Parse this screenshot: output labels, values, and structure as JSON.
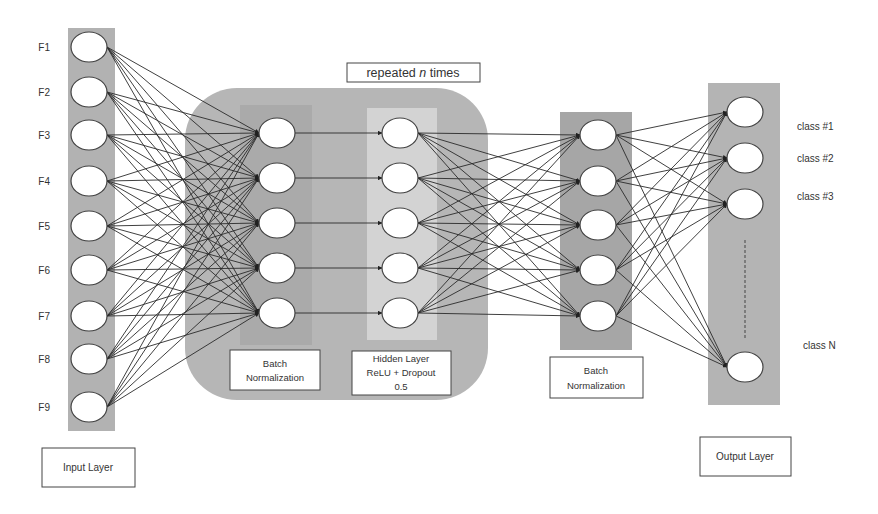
{
  "colors": {
    "background": "#ffffff",
    "input_column": "#b2b2b2",
    "repeated_block": "#b6b6b6",
    "bn_inner": "#a9a9a9",
    "hidden_inner": "#d3d3d3",
    "bn2_column": "#a6a6a6",
    "output_column": "#b4b4b4",
    "node_fill": "#ffffff",
    "node_stroke": "#444444",
    "edge": "#2a2a2a"
  },
  "input_layer": {
    "label": "Input Layer",
    "features": [
      "F1",
      "F2",
      "F3",
      "F4",
      "F5",
      "F6",
      "F7",
      "F8",
      "F9"
    ]
  },
  "repeated_block": {
    "label_prefix": "repeated ",
    "label_var": "n",
    "label_suffix": " times",
    "batch_norm": {
      "label_line1": "Batch",
      "label_line2": "Normalization",
      "nodes": 5
    },
    "hidden_layer": {
      "label_line1": "Hidden Layer",
      "label_line2": "ReLU + Dropout",
      "label_line3": "0.5",
      "nodes": 5
    }
  },
  "batch_norm_2": {
    "label_line1": "Batch",
    "label_line2": "Normalization",
    "nodes": 5
  },
  "output_layer": {
    "label": "Output Layer",
    "classes": [
      "class #1",
      "class #2",
      "class #3",
      "class N"
    ]
  }
}
